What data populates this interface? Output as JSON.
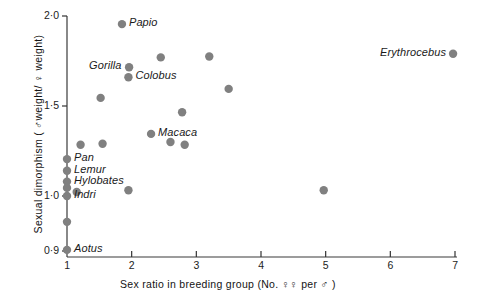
{
  "chart_data": {
    "type": "scatter",
    "title": "",
    "xlabel": "Sex ratio in breeding group (No. ♀♀ per ♂ )",
    "ylabel": "Sexual dimorphism ( ♂weight/ ♀ weight)",
    "xlim": [
      1,
      7
    ],
    "ylim": [
      0.9,
      2.0
    ],
    "xticks": [
      "1",
      "2",
      "3",
      "4",
      "5",
      "6",
      "7"
    ],
    "yticks": [
      "2·0",
      "1·5",
      "1·0",
      "0·9"
    ],
    "ytick_values": [
      2.0,
      1.5,
      1.0,
      0.9
    ],
    "grid": false,
    "legend": "none",
    "note_axis_break": "y-axis scale expands below 1.0",
    "marker_color": "#808080",
    "axis_color": "#333333",
    "points": [
      {
        "label": "Papio",
        "x": 1.85,
        "y": 1.955,
        "label_pos": "right"
      },
      {
        "label": "",
        "x": 2.45,
        "y": 1.77,
        "label_pos": "none"
      },
      {
        "label": "Gorilla",
        "x": 1.96,
        "y": 1.715,
        "label_pos": "left"
      },
      {
        "label": "Colobus",
        "x": 1.95,
        "y": 1.66,
        "label_pos": "right"
      },
      {
        "label": "",
        "x": 3.2,
        "y": 1.775,
        "label_pos": "none"
      },
      {
        "label": "Erythrocebus",
        "x": 6.97,
        "y": 1.79,
        "label_pos": "left"
      },
      {
        "label": "",
        "x": 3.5,
        "y": 1.595,
        "label_pos": "none"
      },
      {
        "label": "",
        "x": 1.52,
        "y": 1.545,
        "label_pos": "none"
      },
      {
        "label": "",
        "x": 2.78,
        "y": 1.465,
        "label_pos": "none"
      },
      {
        "label": "Macaca",
        "x": 2.3,
        "y": 1.345,
        "label_pos": "right"
      },
      {
        "label": "",
        "x": 2.6,
        "y": 1.3,
        "label_pos": "none"
      },
      {
        "label": "",
        "x": 2.82,
        "y": 1.285,
        "label_pos": "none"
      },
      {
        "label": "",
        "x": 1.55,
        "y": 1.29,
        "label_pos": "none"
      },
      {
        "label": "",
        "x": 1.21,
        "y": 1.285,
        "label_pos": "none"
      },
      {
        "label": "Pan",
        "x": 1.0,
        "y": 1.205,
        "label_pos": "right"
      },
      {
        "label": "Lemur",
        "x": 1.0,
        "y": 1.14,
        "label_pos": "right"
      },
      {
        "label": "Hylobates",
        "x": 1.0,
        "y": 1.08,
        "label_pos": "right"
      },
      {
        "label": "",
        "x": 1.0,
        "y": 1.045,
        "label_pos": "none"
      },
      {
        "label": "",
        "x": 1.15,
        "y": 1.022,
        "label_pos": "none"
      },
      {
        "label": "",
        "x": 1.95,
        "y": 1.032,
        "label_pos": "none"
      },
      {
        "label": "",
        "x": 4.97,
        "y": 1.032,
        "label_pos": "none"
      },
      {
        "label": "Indri",
        "x": 1.0,
        "y": 1.0,
        "label_pos": "right"
      },
      {
        "label": "",
        "x": 1.0,
        "y": 0.953,
        "label_pos": "none"
      },
      {
        "label": "Aotus",
        "x": 1.0,
        "y": 0.902,
        "label_pos": "right"
      }
    ]
  },
  "labels": {
    "papio": "Papio",
    "gorilla": "Gorilla",
    "colobus": "Colobus",
    "erythrocebus": "Erythrocebus",
    "macaca": "Macaca",
    "pan": "Pan",
    "lemur": "Lemur",
    "hylobates": "Hylobates",
    "indri": "Indri",
    "aotus": "Aotus"
  },
  "axis": {
    "x_ticks": [
      "1",
      "2",
      "3",
      "4",
      "5",
      "6",
      "7"
    ],
    "y_ticks": [
      "2·0",
      "1·5",
      "1·0",
      "0·9"
    ],
    "x_title_pre": "Sex ratio in breeding group (No. ",
    "x_title_female": "♀♀",
    "x_title_mid": " per ",
    "x_title_male": "♂",
    "x_title_post": " )",
    "y_title_pre": "Sexual dimorphism ( ",
    "y_title_male": "♂",
    "y_title_mid": "weight/ ",
    "y_title_female": "♀",
    "y_title_post": " weight)"
  }
}
